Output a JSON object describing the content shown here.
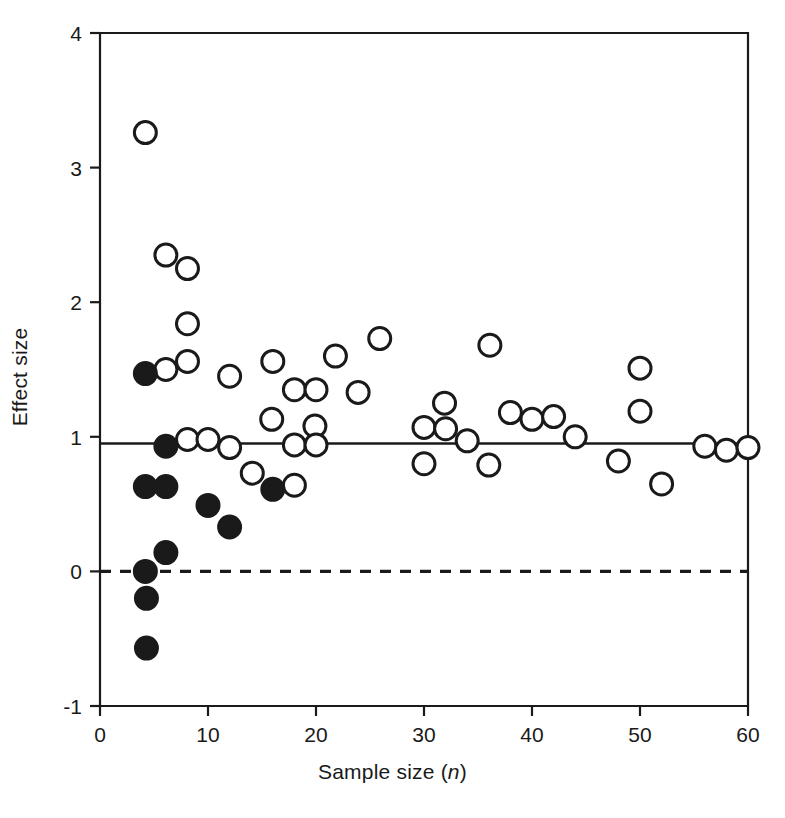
{
  "chart_data": {
    "type": "scatter",
    "title": "",
    "xlabel": "Sample size (n)",
    "xlabel_plain": "Sample size",
    "xlabel_italic_symbol": "n",
    "ylabel": "Effect size",
    "xlim": [
      0,
      60
    ],
    "ylim": [
      -1,
      4
    ],
    "xticks": [
      0,
      10,
      20,
      30,
      40,
      50,
      60
    ],
    "xtick_labels": [
      "0",
      "10",
      "20",
      "30",
      "40",
      "50",
      "60"
    ],
    "yticks": [
      -1,
      0,
      1,
      2,
      3,
      4
    ],
    "ytick_labels": [
      "-1",
      "0",
      "1",
      "2",
      "3",
      "4"
    ],
    "grid": false,
    "legend": null,
    "reference_lines": [
      {
        "name": "mean-effect-line",
        "orientation": "horizontal",
        "y": 0.95,
        "style": "solid",
        "color": "#1a1a1a"
      },
      {
        "name": "zero-effect-line",
        "orientation": "horizontal",
        "y": 0.0,
        "style": "dashed",
        "color": "#1a1a1a"
      }
    ],
    "marker_styles": {
      "open": {
        "name": "open-circle",
        "fill": "#ffffff",
        "stroke": "#1a1a1a",
        "radius_px": 11
      },
      "filled": {
        "name": "filled-circle",
        "fill": "#1a1a1a",
        "stroke": "#1a1a1a",
        "radius_px": 11
      }
    },
    "series": [
      {
        "name": "open-circles",
        "marker": "open",
        "points": [
          [
            4.2,
            3.26
          ],
          [
            6.1,
            2.35
          ],
          [
            8.1,
            2.25
          ],
          [
            8.1,
            1.84
          ],
          [
            6.1,
            1.5
          ],
          [
            8.1,
            1.56
          ],
          [
            12.0,
            1.45
          ],
          [
            16.0,
            1.56
          ],
          [
            21.8,
            1.6
          ],
          [
            25.9,
            1.73
          ],
          [
            36.1,
            1.68
          ],
          [
            18.0,
            1.35
          ],
          [
            20.0,
            1.35
          ],
          [
            23.9,
            1.33
          ],
          [
            15.9,
            1.13
          ],
          [
            19.9,
            1.08
          ],
          [
            31.9,
            1.25
          ],
          [
            50.0,
            1.51
          ],
          [
            50.0,
            1.19
          ],
          [
            38.0,
            1.18
          ],
          [
            40.0,
            1.13
          ],
          [
            42.0,
            1.15
          ],
          [
            8.1,
            0.98
          ],
          [
            10.0,
            0.98
          ],
          [
            12.0,
            0.92
          ],
          [
            18.0,
            0.94
          ],
          [
            20.0,
            0.94
          ],
          [
            30.0,
            1.07
          ],
          [
            32.0,
            1.06
          ],
          [
            34.0,
            0.97
          ],
          [
            44.0,
            1.0
          ],
          [
            56.0,
            0.93
          ],
          [
            58.0,
            0.9
          ],
          [
            60.0,
            0.92
          ],
          [
            14.1,
            0.73
          ],
          [
            18.0,
            0.64
          ],
          [
            30.0,
            0.8
          ],
          [
            36.0,
            0.79
          ],
          [
            48.0,
            0.82
          ],
          [
            52.0,
            0.65
          ]
        ]
      },
      {
        "name": "filled-circles",
        "marker": "filled",
        "points": [
          [
            4.2,
            1.47
          ],
          [
            6.1,
            0.93
          ],
          [
            4.2,
            0.63
          ],
          [
            6.1,
            0.63
          ],
          [
            10.0,
            0.49
          ],
          [
            12.0,
            0.33
          ],
          [
            6.1,
            0.14
          ],
          [
            4.2,
            0.0
          ],
          [
            4.3,
            -0.2
          ],
          [
            4.3,
            -0.57
          ],
          [
            16.0,
            0.61
          ]
        ]
      }
    ]
  },
  "axes": {
    "tick_font_size": 21,
    "axis_color": "#1a1a1a"
  }
}
